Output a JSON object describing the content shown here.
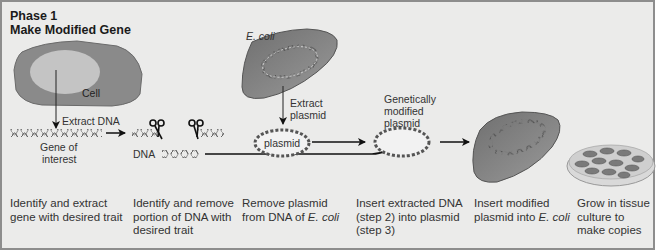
{
  "title": {
    "line1": "Phase 1",
    "line2": "Make Modified Gene"
  },
  "labels": {
    "cell": "Cell",
    "extract_dna": "Extract DNA",
    "gene_of_interest_1": "Gene of",
    "gene_of_interest_2": "interest",
    "dna": "DNA",
    "ecoli": "E. coli",
    "extract_plasmid_1": "Extract",
    "extract_plasmid_2": "plasmid",
    "plasmid": "plasmid",
    "gm_plasmid_1": "Genetically",
    "gm_plasmid_2": "modified",
    "gm_plasmid_3": "plasmid"
  },
  "steps": [
    {
      "lines": [
        "Identify and extract",
        "gene with desired trait"
      ]
    },
    {
      "lines": [
        "Identify and remove",
        "portion of DNA with",
        "desired trait"
      ]
    },
    {
      "lines": [
        "Remove plasmid",
        "from DNA of "
      ],
      "italic_suffix": "E. coli"
    },
    {
      "lines": [
        "Insert extracted DNA",
        "(step 2) into plasmid",
        "(step 3)"
      ]
    },
    {
      "lines": [
        "Insert modified",
        "plasmid into "
      ],
      "italic_suffix": "E. coli"
    },
    {
      "lines": [
        "Grow in tissue",
        "culture to",
        "make copies"
      ]
    }
  ],
  "colors": {
    "background": "#ebebea",
    "border": "#8d8d8d",
    "cell_outer": "#8a8a8a",
    "cell_inner": "#c4c4c4",
    "bacterium": "#7d7d7d",
    "text": "#333333"
  }
}
